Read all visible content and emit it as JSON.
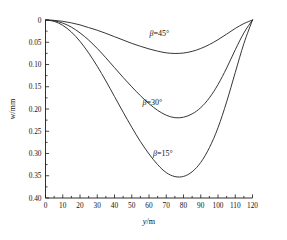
{
  "chart_data": {
    "type": "line",
    "title": "",
    "xlabel": "y/m",
    "ylabel": "w/mm",
    "xlim": [
      0,
      120
    ],
    "ylim": [
      0,
      0.4
    ],
    "y_axis_inverted": true,
    "grid": false,
    "legend_position": "inline-annotations",
    "xticks": [
      0,
      10,
      20,
      30,
      40,
      50,
      60,
      70,
      80,
      90,
      100,
      110,
      120
    ],
    "xticklabels": [
      "0",
      "10",
      "20",
      "30",
      "40",
      "50",
      "60",
      "70",
      "80",
      "90",
      "100",
      "110",
      "120"
    ],
    "yticks": [
      0,
      0.05,
      0.1,
      0.15,
      0.2,
      0.25,
      0.3,
      0.35,
      0.4
    ],
    "yticklabels": [
      "0",
      "0.05",
      "0.10",
      "0.15",
      "0.20",
      "0.25",
      "0.30",
      "0.35",
      "0.40"
    ],
    "x": [
      0,
      5,
      10,
      15,
      20,
      25,
      30,
      35,
      40,
      45,
      50,
      55,
      60,
      65,
      70,
      75,
      80,
      85,
      90,
      95,
      100,
      105,
      110,
      115,
      120
    ],
    "series": [
      {
        "name": "beta-45",
        "label": "β=45°",
        "label_x": 66,
        "label_y": 0.035,
        "min_value": 0.075,
        "min_at_x": 66,
        "color": "#2b2b2b",
        "values": [
          0,
          0.0008,
          0.003,
          0.0065,
          0.011,
          0.017,
          0.023,
          0.03,
          0.0375,
          0.045,
          0.0525,
          0.059,
          0.065,
          0.07,
          0.0738,
          0.0752,
          0.0742,
          0.0705,
          0.064,
          0.0552,
          0.0442,
          0.0318,
          0.019,
          0.008,
          0
        ]
      },
      {
        "name": "beta-30",
        "label": "β=30°",
        "label_x": 62,
        "label_y": 0.192,
        "min_value": 0.22,
        "min_at_x": 68,
        "color": "#2b2b2b",
        "values": [
          0,
          0.0018,
          0.007,
          0.016,
          0.029,
          0.045,
          0.064,
          0.085,
          0.107,
          0.129,
          0.15,
          0.17,
          0.188,
          0.203,
          0.214,
          0.2195,
          0.2185,
          0.211,
          0.197,
          0.175,
          0.145,
          0.108,
          0.067,
          0.029,
          0
        ]
      },
      {
        "name": "beta-15",
        "label": "β=15°",
        "label_x": 68,
        "label_y": 0.305,
        "min_value": 0.352,
        "min_at_x": 70,
        "color": "#2b2b2b",
        "values": [
          0,
          0.003,
          0.012,
          0.027,
          0.048,
          0.074,
          0.104,
          0.137,
          0.172,
          0.207,
          0.241,
          0.273,
          0.301,
          0.325,
          0.343,
          0.3518,
          0.3515,
          0.341,
          0.32,
          0.287,
          0.242,
          0.184,
          0.118,
          0.053,
          0
        ]
      }
    ]
  },
  "annotations": {
    "y_axis_title": "w/mm",
    "x_axis_title": "y/m"
  }
}
